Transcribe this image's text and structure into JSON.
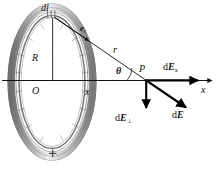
{
  "figure": {
    "type": "physics-vector-diagram",
    "background_color": "#ffffff",
    "ink_color": "#111111"
  },
  "labels": {
    "dl": "dl",
    "e_r": "e",
    "e_r_sub": "r",
    "r": "r",
    "R": "R",
    "O": "O",
    "x_distance": "x",
    "theta": "θ",
    "P": "P",
    "dE_x": "dE",
    "dE_x_sub": "x",
    "x_axis": "x",
    "dE_perp": "dE",
    "dE_perp_sub": "⊥",
    "dE": "dE",
    "charge_sign": "+"
  },
  "geometry": {
    "ring_center": [
      52,
      82
    ],
    "ring_radius_x": 40,
    "ring_radius_y": 74,
    "source_point_dl": [
      53,
      16
    ],
    "field_point_P": [
      146,
      80
    ],
    "axis_y": 80,
    "axis_x_start": 2,
    "axis_x_end": 215,
    "theta_degrees": 35
  },
  "colors": {
    "ring_outer_shade": "#8c8c8c",
    "ring_band_light": "#e2e2e2",
    "ring_band_mid": "#b4b4b4",
    "ring_band_dark": "#6e6e6e",
    "line": "#111111",
    "vector": "#000000"
  },
  "vectors": [
    {
      "name": "e_r",
      "from": "dl",
      "direction": "toward P",
      "label": "e_r",
      "kind": "unit-vector"
    },
    {
      "name": "r",
      "from": "dl",
      "to": "P",
      "label": "r",
      "kind": "distance-line"
    },
    {
      "name": "dE_x",
      "at": "P",
      "direction": "+x",
      "label": "dE_x",
      "kind": "component"
    },
    {
      "name": "dE_perp",
      "at": "P",
      "direction": "-y",
      "label": "dE_perp",
      "kind": "component"
    },
    {
      "name": "dE",
      "at": "P",
      "direction": "down-right",
      "label": "dE",
      "kind": "resultant"
    }
  ]
}
